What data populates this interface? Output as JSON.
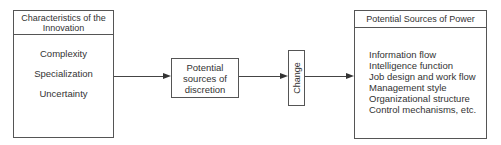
{
  "left_box": {
    "title": "Characteristics of the Innovation",
    "items": [
      "Complexity",
      "Specialization",
      "Uncertainty"
    ]
  },
  "middle_box": {
    "lines": [
      "Potential",
      "sources of",
      "discretion"
    ]
  },
  "change_box": {
    "label": "Change"
  },
  "right_box": {
    "title": "Potential Sources of Power",
    "items": [
      "Information flow",
      "Intelligence function",
      "Job design and work flow",
      "Management style",
      "Organizational structure",
      "Control mechanisms, etc."
    ]
  }
}
